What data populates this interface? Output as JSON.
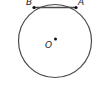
{
  "diagram": {
    "type": "circle-with-chord",
    "labels": {
      "center": "O",
      "point_a": "A",
      "point_b": "B"
    },
    "colors": {
      "stroke": "#4a4a4a",
      "point": "#111111"
    }
  }
}
